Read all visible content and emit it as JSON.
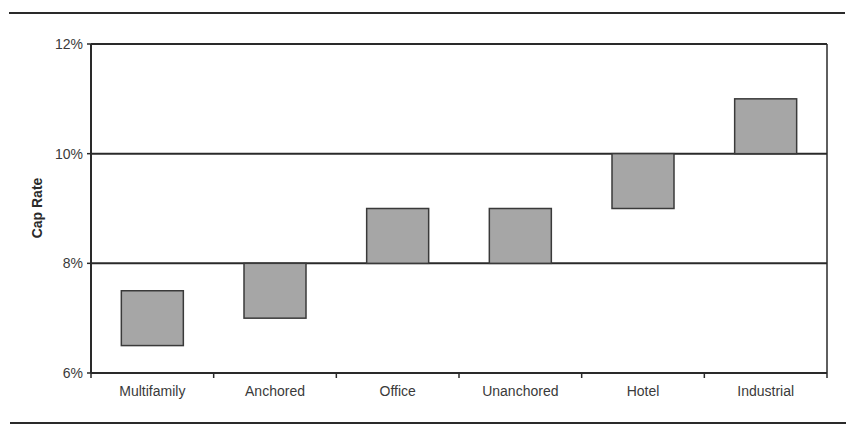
{
  "chart_data": {
    "type": "bar",
    "subtype": "floating-range",
    "title": "",
    "xlabel": "",
    "ylabel": "Cap Rate",
    "ylim": [
      0.06,
      0.12
    ],
    "yticks": [
      "6%",
      "8%",
      "10%",
      "12%"
    ],
    "grid": "horizontal major at 8%, 10%, 12%",
    "legend": null,
    "categories": [
      "Multifamily",
      "Anchored",
      "Office",
      "Unanchored",
      "Hotel",
      "Industrial"
    ],
    "series": [
      {
        "name": "Low",
        "values": [
          6.5,
          7.0,
          8.0,
          8.0,
          9.0,
          10.0
        ]
      },
      {
        "name": "High",
        "values": [
          7.5,
          8.0,
          9.0,
          9.0,
          10.0,
          11.0
        ]
      }
    ],
    "units": "%",
    "colors": {
      "bar_fill": "#a6a6a6",
      "bar_stroke": "#3a3a3a",
      "axis": "#2a2a2a"
    }
  }
}
